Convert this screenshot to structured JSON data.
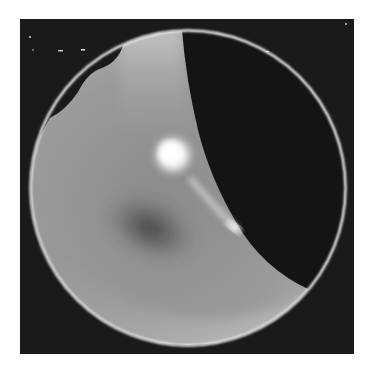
{
  "image": {
    "description": "Grayscale circular field-of-view image with a bright white rim, a dark crescent region on the right, and a bright spot near center",
    "caption": "",
    "colors": {
      "page_background": "#ffffff",
      "frame_background": "#1a1a1a",
      "field_gray": "#8c8c8c",
      "rim": "#f2f2f2",
      "dark_region": "#141414",
      "bright_spot": "#fafafa"
    }
  }
}
